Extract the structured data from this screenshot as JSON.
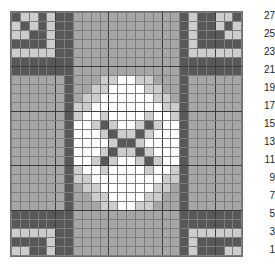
{
  "chart_data": {
    "type": "heatmap",
    "title": "",
    "xlabel": "",
    "ylabel": "",
    "rows": 27,
    "columns": 26,
    "grid_on": true,
    "legend_position": "none",
    "row_label_side": "right",
    "row_label_order": "bottom-to-top",
    "row_labels": [
      "27",
      "25",
      "23",
      "21",
      "19",
      "17",
      "15",
      "13",
      "11",
      "9",
      "7",
      "5",
      "3",
      "1"
    ],
    "row_label_rows": [
      27,
      25,
      23,
      21,
      19,
      17,
      15,
      13,
      11,
      9,
      7,
      5,
      3,
      1
    ],
    "palette": {
      "0": "#585858",
      "1": "#a6a6a6",
      "2": "#cdcdcd",
      "3": "#ffffff"
    },
    "palette_names": {
      "0": "dark-gray",
      "1": "medium-gray",
      "2": "light-gray",
      "3": "white"
    },
    "grid_line_color": "#7d7d7d",
    "heavy_line_color": "#3c3c3c",
    "background_color": "#ffffff",
    "heavy_column_breaks": [
      4,
      10,
      16,
      22
    ],
    "heavy_row_breaks": [
      5,
      10,
      16,
      21
    ],
    "cells": [
      [
        0,
        2,
        2,
        0,
        2,
        0,
        0,
        1,
        1,
        1,
        1,
        1,
        1,
        1,
        1,
        1,
        1,
        1,
        1,
        0,
        2,
        0,
        0,
        2,
        2,
        0
      ],
      [
        2,
        0,
        2,
        0,
        2,
        0,
        0,
        1,
        1,
        1,
        1,
        1,
        1,
        1,
        1,
        1,
        1,
        1,
        1,
        0,
        2,
        0,
        0,
        2,
        0,
        2
      ],
      [
        2,
        2,
        0,
        0,
        2,
        0,
        0,
        1,
        1,
        1,
        1,
        1,
        1,
        1,
        1,
        1,
        1,
        1,
        1,
        0,
        2,
        0,
        0,
        0,
        2,
        2
      ],
      [
        0,
        0,
        0,
        0,
        2,
        0,
        0,
        1,
        1,
        1,
        1,
        1,
        1,
        1,
        1,
        1,
        1,
        1,
        1,
        0,
        2,
        0,
        0,
        0,
        0,
        0
      ],
      [
        2,
        2,
        2,
        2,
        2,
        0,
        0,
        1,
        1,
        1,
        1,
        1,
        1,
        1,
        1,
        1,
        1,
        1,
        1,
        0,
        2,
        2,
        2,
        2,
        2,
        2
      ],
      [
        0,
        0,
        0,
        0,
        0,
        0,
        0,
        1,
        1,
        1,
        1,
        1,
        1,
        1,
        1,
        1,
        1,
        1,
        1,
        0,
        0,
        0,
        0,
        0,
        0,
        0
      ],
      [
        0,
        0,
        0,
        0,
        0,
        0,
        0,
        1,
        1,
        1,
        1,
        1,
        1,
        1,
        1,
        1,
        1,
        1,
        1,
        0,
        0,
        0,
        0,
        0,
        0,
        0
      ],
      [
        1,
        1,
        1,
        1,
        1,
        1,
        0,
        1,
        1,
        1,
        2,
        2,
        3,
        3,
        2,
        2,
        1,
        1,
        1,
        0,
        1,
        1,
        1,
        1,
        1,
        1
      ],
      [
        1,
        1,
        1,
        1,
        1,
        1,
        0,
        1,
        1,
        2,
        2,
        3,
        3,
        3,
        3,
        2,
        2,
        1,
        1,
        0,
        1,
        1,
        1,
        1,
        1,
        1
      ],
      [
        1,
        1,
        1,
        1,
        1,
        1,
        0,
        1,
        2,
        2,
        3,
        3,
        3,
        3,
        3,
        3,
        2,
        2,
        1,
        0,
        1,
        1,
        1,
        1,
        1,
        1
      ],
      [
        1,
        1,
        1,
        1,
        1,
        1,
        0,
        2,
        2,
        3,
        3,
        3,
        3,
        3,
        3,
        3,
        3,
        2,
        2,
        0,
        1,
        1,
        1,
        1,
        1,
        1
      ],
      [
        1,
        1,
        1,
        1,
        1,
        1,
        0,
        2,
        3,
        3,
        2,
        3,
        3,
        3,
        3,
        2,
        3,
        3,
        2,
        0,
        1,
        1,
        1,
        1,
        1,
        1
      ],
      [
        1,
        1,
        1,
        1,
        1,
        1,
        0,
        3,
        3,
        2,
        0,
        2,
        3,
        3,
        2,
        0,
        2,
        3,
        3,
        0,
        1,
        1,
        1,
        1,
        1,
        1
      ],
      [
        1,
        1,
        1,
        1,
        1,
        1,
        0,
        3,
        3,
        3,
        2,
        0,
        2,
        2,
        0,
        2,
        3,
        3,
        3,
        0,
        1,
        1,
        1,
        1,
        1,
        1
      ],
      [
        1,
        1,
        1,
        1,
        1,
        1,
        0,
        3,
        3,
        3,
        3,
        2,
        0,
        0,
        2,
        3,
        3,
        3,
        3,
        0,
        1,
        1,
        1,
        1,
        1,
        1
      ],
      [
        1,
        1,
        1,
        1,
        1,
        1,
        0,
        3,
        3,
        3,
        2,
        0,
        2,
        2,
        0,
        2,
        3,
        3,
        3,
        0,
        1,
        1,
        1,
        1,
        1,
        1
      ],
      [
        1,
        1,
        1,
        1,
        1,
        1,
        0,
        3,
        3,
        2,
        0,
        2,
        3,
        3,
        2,
        0,
        2,
        3,
        3,
        0,
        1,
        1,
        1,
        1,
        1,
        1
      ],
      [
        1,
        1,
        1,
        1,
        1,
        1,
        0,
        2,
        3,
        3,
        2,
        3,
        3,
        3,
        3,
        2,
        3,
        3,
        2,
        0,
        1,
        1,
        1,
        1,
        1,
        1
      ],
      [
        1,
        1,
        1,
        1,
        1,
        1,
        0,
        2,
        2,
        3,
        3,
        3,
        3,
        3,
        3,
        3,
        3,
        2,
        2,
        0,
        1,
        1,
        1,
        1,
        1,
        1
      ],
      [
        1,
        1,
        1,
        1,
        1,
        1,
        0,
        1,
        2,
        2,
        3,
        3,
        3,
        3,
        3,
        3,
        2,
        2,
        1,
        0,
        1,
        1,
        1,
        1,
        1,
        1
      ],
      [
        1,
        1,
        1,
        1,
        1,
        1,
        0,
        1,
        1,
        2,
        2,
        3,
        3,
        3,
        3,
        2,
        2,
        1,
        1,
        0,
        1,
        1,
        1,
        1,
        1,
        1
      ],
      [
        1,
        1,
        1,
        1,
        1,
        1,
        0,
        1,
        1,
        1,
        2,
        2,
        3,
        3,
        2,
        2,
        1,
        1,
        1,
        0,
        1,
        1,
        1,
        1,
        1,
        1
      ],
      [
        0,
        0,
        0,
        0,
        0,
        0,
        0,
        1,
        1,
        1,
        1,
        1,
        1,
        1,
        1,
        1,
        1,
        1,
        1,
        0,
        0,
        0,
        0,
        0,
        0,
        0
      ],
      [
        0,
        0,
        0,
        0,
        0,
        0,
        0,
        1,
        1,
        1,
        1,
        1,
        1,
        1,
        1,
        1,
        1,
        1,
        1,
        0,
        0,
        0,
        0,
        0,
        0,
        0
      ],
      [
        2,
        2,
        2,
        2,
        2,
        0,
        0,
        1,
        1,
        1,
        1,
        1,
        1,
        1,
        1,
        1,
        1,
        1,
        1,
        0,
        2,
        2,
        2,
        2,
        2,
        2
      ],
      [
        0,
        0,
        0,
        0,
        2,
        0,
        0,
        1,
        1,
        1,
        1,
        1,
        1,
        1,
        1,
        1,
        1,
        1,
        1,
        0,
        2,
        0,
        0,
        0,
        0,
        0
      ],
      [
        2,
        2,
        0,
        0,
        2,
        0,
        0,
        1,
        1,
        1,
        1,
        1,
        1,
        1,
        1,
        1,
        1,
        1,
        1,
        0,
        2,
        0,
        0,
        0,
        2,
        2
      ]
    ]
  }
}
